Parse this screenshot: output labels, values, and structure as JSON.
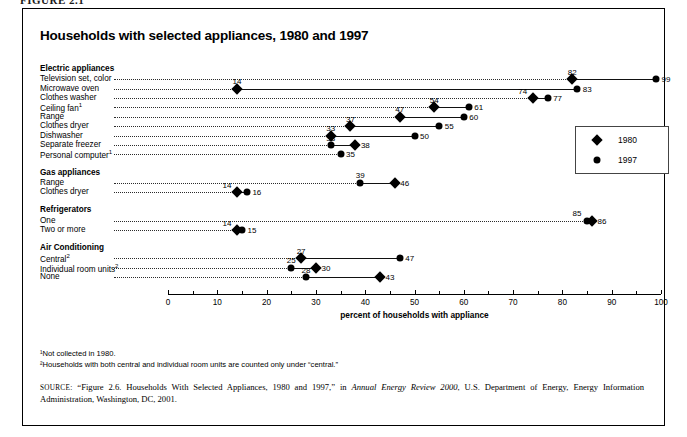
{
  "figure_caption": "FIGURE 2.1",
  "title": "Households with selected appliances, 1980 and 1997",
  "axis": {
    "title": "percent of households with appliance",
    "ticks": [
      0,
      10,
      20,
      30,
      40,
      50,
      60,
      70,
      80,
      90,
      100
    ],
    "min": 0,
    "max": 100
  },
  "legend": {
    "items": [
      {
        "marker": "diamond-marker",
        "label": "1980"
      },
      {
        "marker": "circle-marker",
        "label": "1997"
      }
    ]
  },
  "footnotes": [
    "¹Not collected in 1980.",
    "²Households with both central and individual room units are counted only under “central.”"
  ],
  "source": {
    "label": "SOURCE:",
    "part1": " “Figure 2.6. Households With Selected Appliances, 1980 and 1997,” in ",
    "italic": "Annual Energy Review 2000",
    "part2": ", U.S. Department of Energy, Energy Information Administration, Washington, DC, 2001."
  },
  "chart_data": {
    "type": "scatter",
    "title": "Households with selected appliances, 1980 and 1997",
    "xlabel": "percent of households with appliance",
    "ylabel": "",
    "xlim": [
      0,
      100
    ],
    "grid": false,
    "legend_position": "right-middle",
    "series": [
      {
        "name": "1980",
        "marker": "diamond"
      },
      {
        "name": "1997",
        "marker": "circle"
      }
    ],
    "groups": [
      {
        "group": "Electric appliances",
        "rows": [
          {
            "category": "Television set, color",
            "footnote": "",
            "v1980": 82,
            "v1997": 99
          },
          {
            "category": "Microwave oven",
            "footnote": "",
            "v1980": 14,
            "v1997": 83
          },
          {
            "category": "Clothes washer",
            "footnote": "",
            "v1980": 74,
            "v1997": 77
          },
          {
            "category": "Ceiling fan",
            "footnote": "1",
            "v1980": 54,
            "v1997": 61
          },
          {
            "category": "Range",
            "footnote": "",
            "v1980": 47,
            "v1997": 60
          },
          {
            "category": "Clothes dryer",
            "footnote": "",
            "v1980": 37,
            "v1997": 55
          },
          {
            "category": "Dishwasher",
            "footnote": "",
            "v1980": 33,
            "v1997": 50
          },
          {
            "category": "Separate freezer",
            "footnote": "",
            "v1980": 38,
            "v1997": 33
          },
          {
            "category": "Personal computer",
            "footnote": "1",
            "v1980": null,
            "v1997": 35
          }
        ]
      },
      {
        "group": "Gas appliances",
        "rows": [
          {
            "category": "Range",
            "footnote": "",
            "v1980": 46,
            "v1997": 39
          },
          {
            "category": "Clothes dryer",
            "footnote": "",
            "v1980": 14,
            "v1997": 16
          }
        ]
      },
      {
        "group": "Refrigerators",
        "rows": [
          {
            "category": "One",
            "footnote": "",
            "v1980": 86,
            "v1997": 85
          },
          {
            "category": "Two or more",
            "footnote": "",
            "v1980": 14,
            "v1997": 15
          }
        ]
      },
      {
        "group": "Air Conditioning",
        "rows": [
          {
            "category": "Central",
            "footnote": "2",
            "v1980": 27,
            "v1997": 47
          },
          {
            "category": "Individual room units",
            "footnote": "2",
            "v1980": 30,
            "v1997": 25
          },
          {
            "category": "None",
            "footnote": "",
            "v1980": 43,
            "v1997": 28
          }
        ]
      }
    ]
  }
}
